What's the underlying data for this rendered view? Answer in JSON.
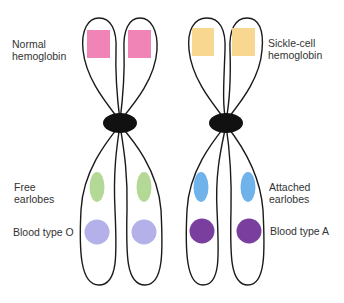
{
  "labels": {
    "normal_hemoglobin": [
      "Normal",
      "hemoglobin"
    ],
    "sickle_hemoglobin": [
      "Sickle-cell",
      "hemoglobin"
    ],
    "free_earlobes": [
      "Free",
      "earlobes"
    ],
    "attached_earlobes": [
      "Attached",
      "earlobes"
    ],
    "blood_type_o": "Blood type O",
    "blood_type_a": "Blood type A"
  },
  "colors": {
    "normal_hemoglobin": "#f07ab0",
    "sickle_hemoglobin": "#f7d488",
    "free_earlobes": "#b4d996",
    "attached_earlobes": "#6fb3ea",
    "blood_type_o": "#b3b0ea",
    "blood_type_a": "#7a3f9e",
    "outline": "#1a1a1a",
    "centromere": "#111111"
  }
}
